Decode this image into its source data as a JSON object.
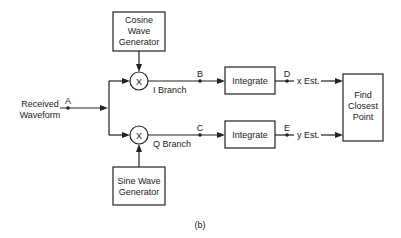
{
  "diagram": {
    "caption": "(b)",
    "input": {
      "line1": "Received",
      "line2": "Waveform",
      "node": "A"
    },
    "cosine_generator": {
      "line1": "Cosine",
      "line2": "Wave",
      "line3": "Generator"
    },
    "sine_generator": {
      "line1": "Sine Wave",
      "line2": "Generator"
    },
    "mixer_top": {
      "symbol": "X"
    },
    "mixer_bottom": {
      "symbol": "X"
    },
    "i_branch": {
      "label": "I Branch",
      "node": "B"
    },
    "q_branch": {
      "label": "Q Branch",
      "node": "C"
    },
    "integrate_top": {
      "label": "Integrate",
      "node": "D",
      "output": "x Est."
    },
    "integrate_bottom": {
      "label": "Integrate",
      "node": "E",
      "output": "y Est."
    },
    "decision": {
      "line1": "Find",
      "line2": "Closest",
      "line3": "Point"
    },
    "colors": {
      "stroke": "#222222",
      "background": "#ffffff"
    }
  }
}
